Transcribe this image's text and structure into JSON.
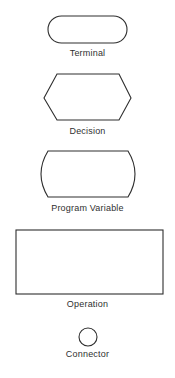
{
  "symbols": [
    {
      "name": "Terminal",
      "shape": "rounded-rectangle (stadium)"
    },
    {
      "name": "Decision",
      "shape": "hexagon"
    },
    {
      "name": "Program Variable",
      "shape": "rectangle with convex curved sides"
    },
    {
      "name": "Operation",
      "shape": "rectangle"
    },
    {
      "name": "Connector",
      "shape": "circle"
    }
  ],
  "colors": {
    "stroke": "#2e2e2e",
    "text": "#303030",
    "background": "#ffffff"
  }
}
